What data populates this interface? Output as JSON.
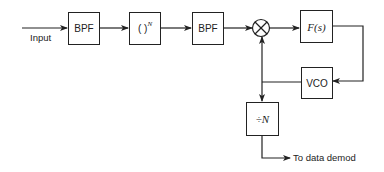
{
  "diagram": {
    "input_label": "Input",
    "blocks": {
      "bpf1": "BPF",
      "power": {
        "base": "( )",
        "exponent": "N"
      },
      "bpf2": "BPF",
      "mixer": "⊗",
      "loop_filter": "F(s)",
      "vco": "VCO",
      "divider": "÷N"
    },
    "output_label": "To data demod",
    "colors": {
      "line": "#222222",
      "background": "#ffffff"
    }
  }
}
